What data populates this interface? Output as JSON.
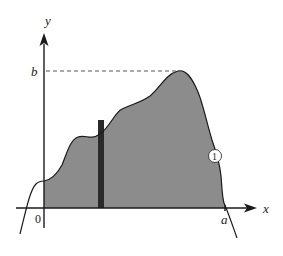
{
  "figure": {
    "type": "area-under-curve diagram",
    "axes": {
      "x_label": "x",
      "y_label": "y",
      "origin_label": "0"
    },
    "labels": {
      "b": "b",
      "a": "a",
      "curve_marker": "1"
    },
    "colors": {
      "fill": "#8c8c8c",
      "strip": "#2a2a2a",
      "line": "#1a1a1a",
      "dashed": "#555555",
      "background": "#ffffff"
    },
    "elements": {
      "shaded_region": "area under curve from 0 to a",
      "strip": "thin vertical rectangular strip inside region",
      "dashed_line": "horizontal dashed line at height b to curve maximum",
      "curve_label": "circled 1"
    }
  }
}
